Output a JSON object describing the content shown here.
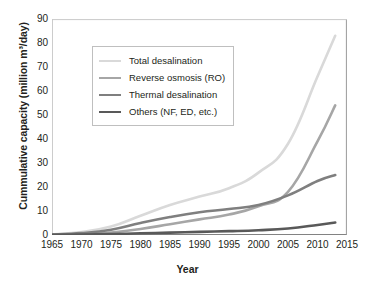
{
  "chart_data": {
    "type": "line",
    "title": "",
    "xlabel": "Year",
    "ylabel": "Cummulative capacity (million m³/day)",
    "xlim": [
      1965,
      2015
    ],
    "ylim": [
      0,
      90
    ],
    "xticks": [
      1965,
      1970,
      1975,
      1980,
      1985,
      1990,
      1995,
      2000,
      2005,
      2010,
      2015
    ],
    "yticks": [
      0,
      10,
      20,
      30,
      40,
      50,
      60,
      70,
      80,
      90
    ],
    "grid": false,
    "legend_position": "upper-left-inside",
    "x": [
      1965,
      1970,
      1975,
      1980,
      1985,
      1990,
      1995,
      2000,
      2005,
      2010,
      2013
    ],
    "series": [
      {
        "name": "Total desalination",
        "color": "#d9d9d9",
        "width": 2.6,
        "values": [
          0.3,
          1.2,
          3.5,
          8.0,
          12.5,
          16.0,
          19.5,
          26.0,
          38.0,
          66.0,
          83.0
        ]
      },
      {
        "name": "Reverse osmosis (RO)",
        "color": "#a6a6a6",
        "width": 2.6,
        "values": [
          0.1,
          0.3,
          1.0,
          2.5,
          4.5,
          6.5,
          8.5,
          12.0,
          18.0,
          39.0,
          54.0
        ]
      },
      {
        "name": "Thermal desalination",
        "color": "#7f7f7f",
        "width": 2.6,
        "values": [
          0.2,
          0.8,
          2.2,
          5.0,
          7.5,
          9.5,
          10.8,
          12.5,
          16.5,
          22.5,
          25.0
        ]
      },
      {
        "name": "Others (NF, ED, etc.)",
        "color": "#595959",
        "width": 2.6,
        "values": [
          0.05,
          0.15,
          0.4,
          0.7,
          1.0,
          1.3,
          1.6,
          2.0,
          2.7,
          4.2,
          5.2
        ]
      }
    ]
  }
}
